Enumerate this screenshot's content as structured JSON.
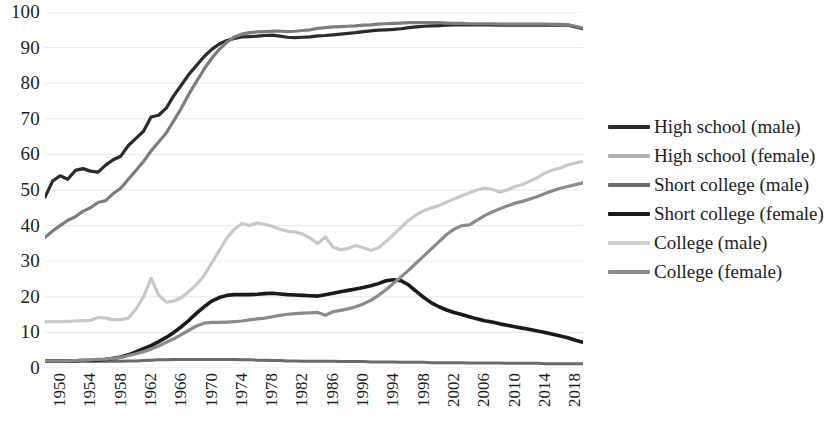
{
  "chart_data": {
    "type": "line",
    "title": "",
    "xlabel": "",
    "ylabel": "",
    "ylim": [
      0,
      100
    ],
    "xlim": [
      1950,
      2021
    ],
    "ytick_labels": [
      "100",
      "90",
      "80",
      "70",
      "60",
      "50",
      "40",
      "30",
      "20",
      "10",
      "0"
    ],
    "ytick_values": [
      100,
      90,
      80,
      70,
      60,
      50,
      40,
      30,
      20,
      10,
      0
    ],
    "xtick_labels": [
      "1950",
      "1954",
      "1958",
      "1962",
      "1966",
      "1970",
      "1974",
      "1978",
      "1982",
      "1986",
      "1990",
      "1994",
      "1998",
      "2002",
      "2006",
      "2010",
      "2014",
      "2018"
    ],
    "xtick_values": [
      1950,
      1954,
      1958,
      1962,
      1966,
      1970,
      1974,
      1978,
      1982,
      1986,
      1990,
      1994,
      1998,
      2002,
      2006,
      2010,
      2014,
      2018
    ],
    "grid": "horizontal",
    "legend_position": "right",
    "x": [
      1950,
      1951,
      1952,
      1953,
      1954,
      1955,
      1956,
      1957,
      1958,
      1959,
      1960,
      1961,
      1962,
      1963,
      1964,
      1965,
      1966,
      1967,
      1968,
      1969,
      1970,
      1971,
      1972,
      1973,
      1974,
      1975,
      1976,
      1977,
      1978,
      1979,
      1980,
      1981,
      1982,
      1983,
      1984,
      1985,
      1986,
      1987,
      1988,
      1989,
      1990,
      1991,
      1992,
      1993,
      1994,
      1995,
      1996,
      1997,
      1998,
      1999,
      2000,
      2001,
      2002,
      2003,
      2004,
      2005,
      2006,
      2007,
      2008,
      2009,
      2010,
      2011,
      2012,
      2013,
      2014,
      2015,
      2016,
      2017,
      2018,
      2019,
      2020,
      2021
    ],
    "series": [
      {
        "name": "High school (male)",
        "color": "#2b2b2b",
        "width": 3.2,
        "values": [
          48.0,
          52.5,
          54.0,
          53.0,
          55.5,
          56.0,
          55.3,
          55.0,
          57.0,
          58.5,
          59.5,
          62.5,
          64.5,
          66.5,
          70.5,
          71.0,
          73.0,
          76.5,
          79.5,
          82.5,
          85.0,
          87.5,
          89.5,
          91.0,
          92.0,
          92.6,
          93.0,
          93.1,
          93.2,
          93.4,
          93.5,
          93.2,
          92.9,
          92.8,
          92.9,
          93.0,
          93.3,
          93.4,
          93.6,
          93.8,
          94.0,
          94.2,
          94.5,
          94.7,
          94.9,
          95.0,
          95.1,
          95.3,
          95.6,
          95.8,
          96.0,
          96.1,
          96.2,
          96.3,
          96.4,
          96.4,
          96.4,
          96.4,
          96.4,
          96.4,
          96.3,
          96.3,
          96.3,
          96.3,
          96.3,
          96.3,
          96.3,
          96.3,
          96.3,
          96.3,
          95.8,
          95.3
        ]
      },
      {
        "name": "High school (female)",
        "color": "#7d7d7d",
        "width": 3.2,
        "values": [
          36.7,
          38.5,
          40.0,
          41.5,
          42.5,
          44.0,
          45.0,
          46.5,
          47.0,
          49.0,
          50.5,
          53.0,
          55.5,
          58.0,
          61.0,
          63.5,
          66.0,
          69.5,
          73.0,
          77.0,
          80.5,
          84.0,
          87.0,
          89.5,
          91.5,
          93.0,
          93.8,
          94.2,
          94.4,
          94.5,
          94.6,
          94.6,
          94.5,
          94.6,
          94.8,
          95.0,
          95.4,
          95.6,
          95.8,
          95.9,
          96.0,
          96.1,
          96.3,
          96.4,
          96.6,
          96.7,
          96.8,
          96.9,
          97.0,
          97.0,
          97.0,
          97.0,
          97.0,
          96.9,
          96.8,
          96.8,
          96.7,
          96.7,
          96.7,
          96.7,
          96.6,
          96.6,
          96.6,
          96.6,
          96.6,
          96.6,
          96.6,
          96.5,
          96.5,
          96.4,
          96.0,
          95.5
        ]
      },
      {
        "name": "Short college (male)",
        "color": "#6a6a6a",
        "width": 3.0,
        "values": [
          2.0,
          2.0,
          2.0,
          2.0,
          2.0,
          2.0,
          1.9,
          1.9,
          1.9,
          1.9,
          1.9,
          2.0,
          2.0,
          2.1,
          2.2,
          2.3,
          2.3,
          2.4,
          2.4,
          2.4,
          2.4,
          2.4,
          2.4,
          2.4,
          2.4,
          2.4,
          2.3,
          2.3,
          2.2,
          2.2,
          2.1,
          2.1,
          2.0,
          2.0,
          1.9,
          1.9,
          1.9,
          1.9,
          1.9,
          1.8,
          1.8,
          1.8,
          1.8,
          1.7,
          1.7,
          1.7,
          1.7,
          1.6,
          1.6,
          1.6,
          1.6,
          1.5,
          1.5,
          1.5,
          1.5,
          1.5,
          1.4,
          1.4,
          1.4,
          1.4,
          1.4,
          1.3,
          1.3,
          1.3,
          1.3,
          1.3,
          1.2,
          1.2,
          1.2,
          1.2,
          1.2,
          1.2
        ]
      },
      {
        "name": "Short college (female)",
        "color": "#1a1a1a",
        "width": 3.6,
        "values": [
          2.0,
          2.0,
          2.0,
          2.0,
          2.0,
          2.1,
          2.1,
          2.2,
          2.4,
          2.7,
          3.1,
          3.7,
          4.5,
          5.4,
          6.3,
          7.4,
          8.6,
          10.0,
          11.6,
          13.4,
          15.4,
          17.2,
          18.8,
          19.8,
          20.4,
          20.6,
          20.6,
          20.6,
          20.7,
          20.9,
          21.0,
          20.8,
          20.6,
          20.5,
          20.4,
          20.3,
          20.2,
          20.6,
          21.0,
          21.4,
          21.8,
          22.2,
          22.6,
          23.1,
          23.7,
          24.5,
          24.8,
          24.5,
          23.3,
          21.5,
          19.8,
          18.3,
          17.2,
          16.3,
          15.6,
          15.0,
          14.4,
          13.8,
          13.3,
          12.9,
          12.4,
          12.0,
          11.6,
          11.2,
          10.8,
          10.4,
          10.0,
          9.5,
          9.0,
          8.5,
          7.8,
          7.2
        ]
      },
      {
        "name": "College (male)",
        "color": "#c8c8c8",
        "width": 3.2,
        "values": [
          13.0,
          13.0,
          13.0,
          13.1,
          13.2,
          13.3,
          13.4,
          14.2,
          14.0,
          13.6,
          13.6,
          14.0,
          16.5,
          20.0,
          25.2,
          20.5,
          18.5,
          18.8,
          19.8,
          21.5,
          23.5,
          26.0,
          29.5,
          33.0,
          36.5,
          39.0,
          40.6,
          40.0,
          40.8,
          40.3,
          39.8,
          39.0,
          38.4,
          38.2,
          37.6,
          36.4,
          35.0,
          36.8,
          34.0,
          33.2,
          33.6,
          34.4,
          33.8,
          33.0,
          33.8,
          35.5,
          37.5,
          39.5,
          41.5,
          43.0,
          44.2,
          45.0,
          45.6,
          46.6,
          47.5,
          48.4,
          49.2,
          50.0,
          50.5,
          50.2,
          49.4,
          50.0,
          51.0,
          51.5,
          52.5,
          53.5,
          54.8,
          55.6,
          56.2,
          57.0,
          57.6,
          58.0
        ]
      },
      {
        "name": "College (female)",
        "color": "#8a8a8a",
        "width": 3.2,
        "values": [
          2.0,
          2.0,
          2.0,
          2.0,
          2.1,
          2.2,
          2.3,
          2.4,
          2.5,
          2.7,
          3.0,
          3.5,
          4.0,
          4.6,
          5.3,
          6.2,
          7.2,
          8.2,
          9.4,
          10.6,
          11.8,
          12.6,
          12.8,
          12.8,
          12.9,
          13.0,
          13.2,
          13.5,
          13.8,
          14.0,
          14.4,
          14.8,
          15.1,
          15.3,
          15.4,
          15.5,
          15.6,
          14.8,
          15.8,
          16.2,
          16.6,
          17.2,
          18.0,
          19.0,
          20.4,
          22.0,
          23.8,
          25.6,
          27.5,
          29.5,
          31.5,
          33.5,
          35.5,
          37.5,
          39.0,
          40.0,
          40.2,
          41.5,
          42.8,
          43.8,
          44.7,
          45.5,
          46.3,
          46.8,
          47.5,
          48.2,
          49.0,
          49.8,
          50.5,
          51.0,
          51.5,
          52.0
        ]
      }
    ]
  },
  "legend": {
    "items": [
      {
        "label": "High school (male)",
        "color": "#2b2b2b"
      },
      {
        "label": "High school (female)",
        "color": "#b0b0b0"
      },
      {
        "label": "Short college (male)",
        "color": "#6a6a6a"
      },
      {
        "label": "Short college (female)",
        "color": "#1a1a1a"
      },
      {
        "label": "College (male)",
        "color": "#cfcfcf"
      },
      {
        "label": "College (female)",
        "color": "#8a8a8a"
      }
    ]
  },
  "axes": {
    "gridline_color": "#e8e8e8",
    "label_color": "#1d1d1d"
  }
}
